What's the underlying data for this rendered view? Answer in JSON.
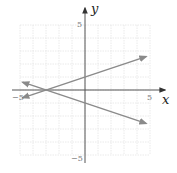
{
  "chart_data": {
    "type": "line",
    "title": "",
    "xlabel": "x",
    "ylabel": "y",
    "xlim": [
      -5,
      5
    ],
    "ylim": [
      -5,
      5
    ],
    "grid": true,
    "tick_labels": {
      "x": [
        {
          "value": -5,
          "label": "−5"
        },
        {
          "value": 5,
          "label": "5"
        }
      ],
      "y": [
        {
          "value": 5,
          "label": "5"
        },
        {
          "value": -5,
          "label": "−5"
        }
      ]
    },
    "series": [
      {
        "name": "line-increasing",
        "equation": "y = (1/3)x + 1",
        "x": [
          -4.8,
          4.7
        ],
        "y": [
          -0.6,
          2.57
        ],
        "arrows": "both"
      },
      {
        "name": "line-decreasing",
        "equation": "y = -(1/3)x - 1",
        "x": [
          -4.8,
          4.7
        ],
        "y": [
          0.6,
          -2.57
        ],
        "arrows": "both"
      }
    ],
    "intersection": {
      "x": -3,
      "y": 0
    }
  },
  "colors": {
    "grid": "#e4e4e4",
    "axis": "#555555",
    "line": "#8a8a8a"
  },
  "labels": {
    "x_axis": "x",
    "y_axis": "y",
    "x_min": "−5",
    "x_max": "5",
    "y_max": "5",
    "y_min": "−5"
  }
}
